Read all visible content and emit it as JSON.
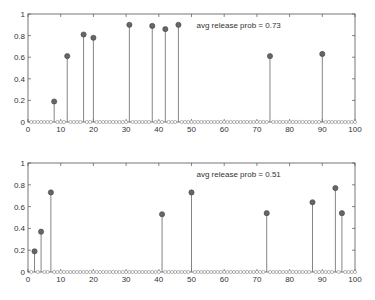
{
  "chart_data": [
    {
      "type": "stem",
      "title": "",
      "annotation": "avg release prob = 0.73",
      "xlabel": "",
      "ylabel": "",
      "xlim": [
        0,
        100
      ],
      "ylim": [
        0,
        1
      ],
      "xticks": [
        0,
        10,
        20,
        30,
        40,
        50,
        60,
        70,
        80,
        90,
        100
      ],
      "yticks": [
        0,
        0.2,
        0.4,
        0.6,
        0.8,
        1
      ],
      "ytick_labels": [
        "0",
        "0.2",
        "0.4",
        "0.6",
        "0.8",
        "1"
      ],
      "grid": false,
      "n_points": 100,
      "nonzero": [
        {
          "x": 8,
          "y": 0.19
        },
        {
          "x": 12,
          "y": 0.61
        },
        {
          "x": 17,
          "y": 0.81
        },
        {
          "x": 20,
          "y": 0.78
        },
        {
          "x": 31,
          "y": 0.9
        },
        {
          "x": 38,
          "y": 0.89
        },
        {
          "x": 42,
          "y": 0.86
        },
        {
          "x": 46,
          "y": 0.9
        },
        {
          "x": 74,
          "y": 0.61
        },
        {
          "x": 90,
          "y": 0.63
        }
      ]
    },
    {
      "type": "stem",
      "title": "",
      "annotation": "avg release prob = 0.51",
      "xlabel": "",
      "ylabel": "",
      "xlim": [
        0,
        100
      ],
      "ylim": [
        0,
        1
      ],
      "xticks": [
        0,
        10,
        20,
        30,
        40,
        50,
        60,
        70,
        80,
        90,
        100
      ],
      "yticks": [
        0,
        0.2,
        0.4,
        0.6,
        0.8,
        1
      ],
      "ytick_labels": [
        "0",
        "0.2",
        "0.4",
        "0.6",
        "0.8",
        "1"
      ],
      "grid": false,
      "n_points": 100,
      "nonzero": [
        {
          "x": 2,
          "y": 0.19
        },
        {
          "x": 4,
          "y": 0.37
        },
        {
          "x": 7,
          "y": 0.73
        },
        {
          "x": 41,
          "y": 0.53
        },
        {
          "x": 50,
          "y": 0.73
        },
        {
          "x": 73,
          "y": 0.54
        },
        {
          "x": 87,
          "y": 0.64
        },
        {
          "x": 94,
          "y": 0.77
        },
        {
          "x": 96,
          "y": 0.54
        }
      ]
    }
  ],
  "colors": {
    "axis": "#555555",
    "stem": "#777777",
    "marker_fill": "#666666",
    "zero_marker": "#888888"
  }
}
